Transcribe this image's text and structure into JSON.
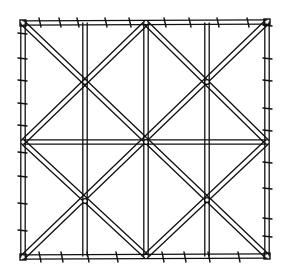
{
  "figure": {
    "title": "Square lattice trellis panel",
    "stroke_color": "#111111",
    "background": "#ffffff",
    "frame": {
      "left": 23,
      "top": 23,
      "right": 267,
      "bottom": 256
    },
    "verticals_x": [
      85,
      146,
      207
    ],
    "horizontal_y": [
      142
    ],
    "nodes": [
      {
        "x": 85,
        "y": 82
      },
      {
        "x": 207,
        "y": 82
      },
      {
        "x": 146,
        "y": 142
      },
      {
        "x": 85,
        "y": 201
      },
      {
        "x": 207,
        "y": 200
      }
    ],
    "ticks": {
      "top_x": [
        40,
        60,
        78,
        106,
        130,
        165,
        190,
        218,
        248
      ],
      "bottom_x": [
        40,
        62,
        88,
        117,
        163,
        185,
        209,
        239
      ],
      "left_y": [
        33,
        58,
        80,
        103,
        125,
        152,
        176,
        203,
        230
      ],
      "right_y": [
        25,
        58,
        80,
        108,
        130,
        162,
        188,
        218,
        236
      ]
    }
  }
}
